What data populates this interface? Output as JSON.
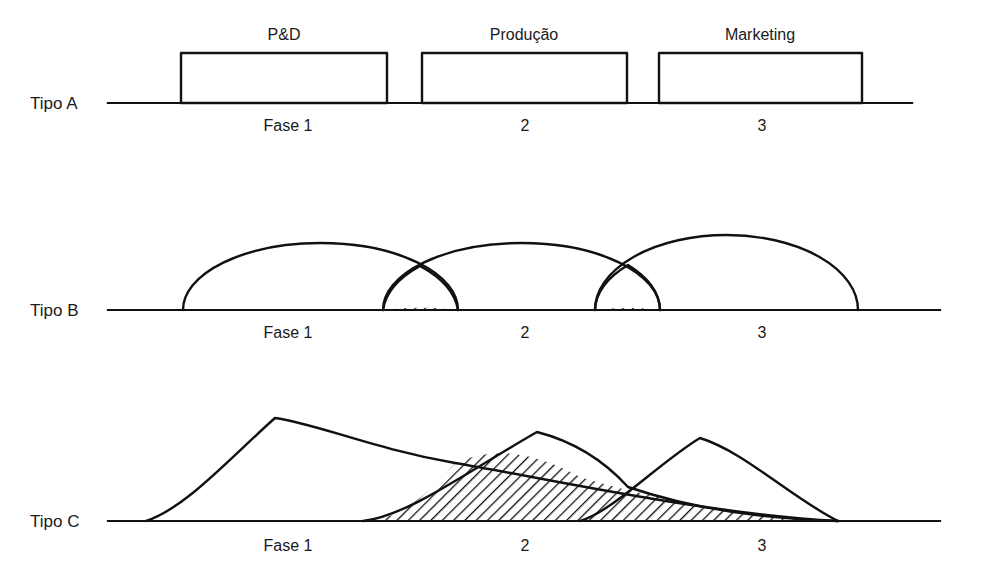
{
  "figure": {
    "background_color": "#ffffff",
    "line_color": "#111111",
    "hatch_color": "#111111"
  },
  "rows": [
    {
      "id": "tipo-a",
      "label": "Tipo A",
      "style": "rectangles",
      "baseline_y": 103,
      "baseline_x_start": 108,
      "baseline_x_end": 912,
      "boxes": [
        {
          "label": "P&D",
          "x": 181,
          "width": 206,
          "top": 53
        },
        {
          "label": "Produção",
          "x": 422,
          "width": 205,
          "top": 53
        },
        {
          "label": "Marketing",
          "x": 659,
          "width": 203,
          "top": 53
        }
      ],
      "phase_labels": [
        {
          "text": "Fase 1",
          "x": 288,
          "y": 131
        },
        {
          "text": "2",
          "x": 525,
          "y": 131
        },
        {
          "text": "3",
          "x": 762,
          "y": 131
        }
      ]
    },
    {
      "id": "tipo-b",
      "label": "Tipo B",
      "style": "arcs",
      "baseline_y": 310,
      "baseline_x_start": 108,
      "baseline_x_end": 940,
      "arcs": [
        {
          "name": "arc-1",
          "x_start": 183,
          "x_end": 458,
          "peak_y": 243
        },
        {
          "name": "arc-2",
          "x_start": 383,
          "x_end": 660,
          "peak_y": 243
        },
        {
          "name": "arc-3",
          "x_start": 595,
          "x_end": 858,
          "peak_y": 235
        }
      ],
      "overlaps": [
        {
          "name": "overlap-1-2",
          "x_start": 383,
          "x_end": 458,
          "cross_x": 420,
          "cross_y": 266,
          "hatched": true
        },
        {
          "name": "overlap-2-3",
          "x_start": 595,
          "x_end": 660,
          "cross_x": 628,
          "cross_y": 265,
          "hatched": true
        }
      ],
      "phase_labels": [
        {
          "text": "Fase 1",
          "x": 288,
          "y": 338
        },
        {
          "text": "2",
          "x": 525,
          "y": 338
        },
        {
          "text": "3",
          "x": 762,
          "y": 338
        }
      ]
    },
    {
      "id": "tipo-c",
      "label": "Tipo C",
      "style": "bell-curves",
      "baseline_y": 521,
      "baseline_x_start": 108,
      "baseline_x_end": 940,
      "curves": [
        {
          "name": "curve-1",
          "x_start": 146,
          "peak_x": 275,
          "peak_y": 418,
          "x_end": 838
        },
        {
          "name": "curve-2",
          "x_start": 363,
          "peak_x": 537,
          "peak_y": 432,
          "x_end": 838
        },
        {
          "name": "curve-3",
          "x_start": 580,
          "peak_x": 700,
          "peak_y": 438,
          "x_end": 838
        }
      ],
      "overlaps": [
        {
          "name": "overlap-1-2",
          "x_start": 363,
          "x_end": 628,
          "cross_x": 455,
          "cross_y": 463,
          "hatched": true
        },
        {
          "name": "overlap-2-3",
          "x_start": 580,
          "x_end": 838,
          "cross_x": 628,
          "cross_y": 487,
          "hatched": true
        }
      ],
      "phase_labels": [
        {
          "text": "Fase 1",
          "x": 288,
          "y": 551
        },
        {
          "text": "2",
          "x": 525,
          "y": 551
        },
        {
          "text": "3",
          "x": 762,
          "y": 551
        }
      ]
    }
  ]
}
